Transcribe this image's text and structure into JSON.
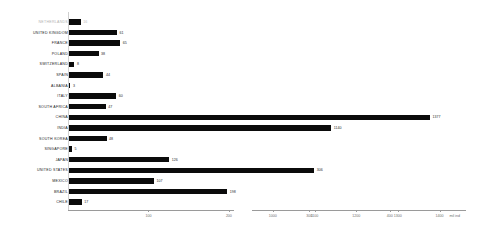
{
  "chart_data": {
    "type": "bar",
    "orientation": "horizontal",
    "title": "",
    "xlabel": "",
    "ylabel": "",
    "unit_label": "mil ind",
    "axis_style": "broken",
    "grid": false,
    "legend": "none",
    "left_axis": {
      "min": 0,
      "max": 450,
      "ticks": [
        100,
        200,
        300,
        400
      ],
      "tick_labels": [
        "100",
        "200",
        "300",
        "400"
      ]
    },
    "right_axis": {
      "min": 950,
      "max": 1430,
      "ticks": [
        1000,
        1100,
        1200,
        1300,
        1400
      ],
      "tick_labels": [
        "1000",
        "1100",
        "1200",
        "1300",
        "1400"
      ]
    },
    "categories": [
      "NETHERLANDS",
      "UNITED KINGDOM",
      "FRANCE",
      "POLAND",
      "SWITZERLAND",
      "SPAIN",
      "ALBANIA",
      "ITALY",
      "SOUTH AFRICA",
      "CHINA",
      "INDIA",
      "SOUTH KOREA",
      "SINGAPORE",
      "JAPAN",
      "UNITED STATES",
      "MEXICO",
      "BRAZIL",
      "CHILE"
    ],
    "values": [
      16,
      61,
      65,
      38,
      8,
      44,
      3,
      60,
      47,
      1377,
      1140,
      48,
      5,
      126,
      306,
      107,
      198,
      17
    ],
    "value_labels": [
      "16",
      "61",
      "65",
      "38",
      "8",
      "44",
      "3",
      "60",
      "47",
      "1377",
      "1140",
      "48",
      "5",
      "126",
      "306",
      "107",
      "198",
      "17"
    ],
    "muted_rows": [
      0
    ],
    "colors": {
      "bar": "#0b0b0b",
      "label": "#1a1a1a",
      "label_muted": "#b3b3b3",
      "axis": "#9a9a9a",
      "tick_text": "#6e6e6e",
      "gridline": "#cfcfcf",
      "background": "#ffffff"
    }
  }
}
